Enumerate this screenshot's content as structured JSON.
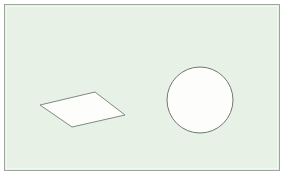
{
  "canvas": {
    "width": 284,
    "height": 177,
    "outer_background_color": "#ffffff",
    "background_color": "#e7f1e5",
    "frame": {
      "name": "image-frame",
      "x": 4,
      "y": 4,
      "width": 276,
      "height": 167,
      "stroke_color": "#9aa89a",
      "stroke_width": 1,
      "inner_highlight_color": "#f2f7f1"
    }
  },
  "shapes": [
    {
      "id": "quadrilateral",
      "label": "Quadrilateral",
      "type": "polygon",
      "fill_color": "#fdfdfc",
      "stroke_color": "#7f8b80",
      "stroke_width": 1,
      "points": "40,105 95,92 125,115 72,127",
      "vertices": [
        {
          "name": "left",
          "x": 40,
          "y": 105
        },
        {
          "name": "top",
          "x": 95,
          "y": 92
        },
        {
          "name": "right",
          "x": 125,
          "y": 115
        },
        {
          "name": "bottom",
          "x": 72,
          "y": 127
        }
      ]
    },
    {
      "id": "circle",
      "label": "Circle",
      "type": "circle",
      "fill_color": "#fdfdfc",
      "stroke_color": "#6f7b70",
      "stroke_width": 1,
      "center_x": 200,
      "center_y": 100,
      "radius": 33
    }
  ]
}
